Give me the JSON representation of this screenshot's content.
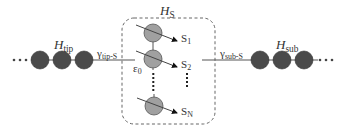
{
  "diagram": {
    "type": "quantum-transport-schematic",
    "colors": {
      "background": "#ffffff",
      "lead_site": "#4a4a4a",
      "system_site": "#a0a0a0",
      "line": "#555555",
      "dashed_box": "#666666",
      "text": "#333333"
    },
    "left_lead": {
      "label_main": "H",
      "label_sub": "tip",
      "coupling_main": "γ",
      "coupling_sub": "tip-S",
      "ellipsis": "⋯",
      "sites": 3
    },
    "system": {
      "label_main": "H",
      "label_sub": "S",
      "energy_main": "ε",
      "energy_sub": "0",
      "states": [
        {
          "main": "S",
          "sub": "1"
        },
        {
          "main": "S",
          "sub": "2"
        },
        {
          "main": "S",
          "sub": "N"
        }
      ],
      "vertical_ellipsis": "⋮"
    },
    "right_lead": {
      "label_main": "H",
      "label_sub": "sub",
      "coupling_main": "γ",
      "coupling_sub": "sub-S",
      "ellipsis": "⋯",
      "sites": 3
    }
  }
}
